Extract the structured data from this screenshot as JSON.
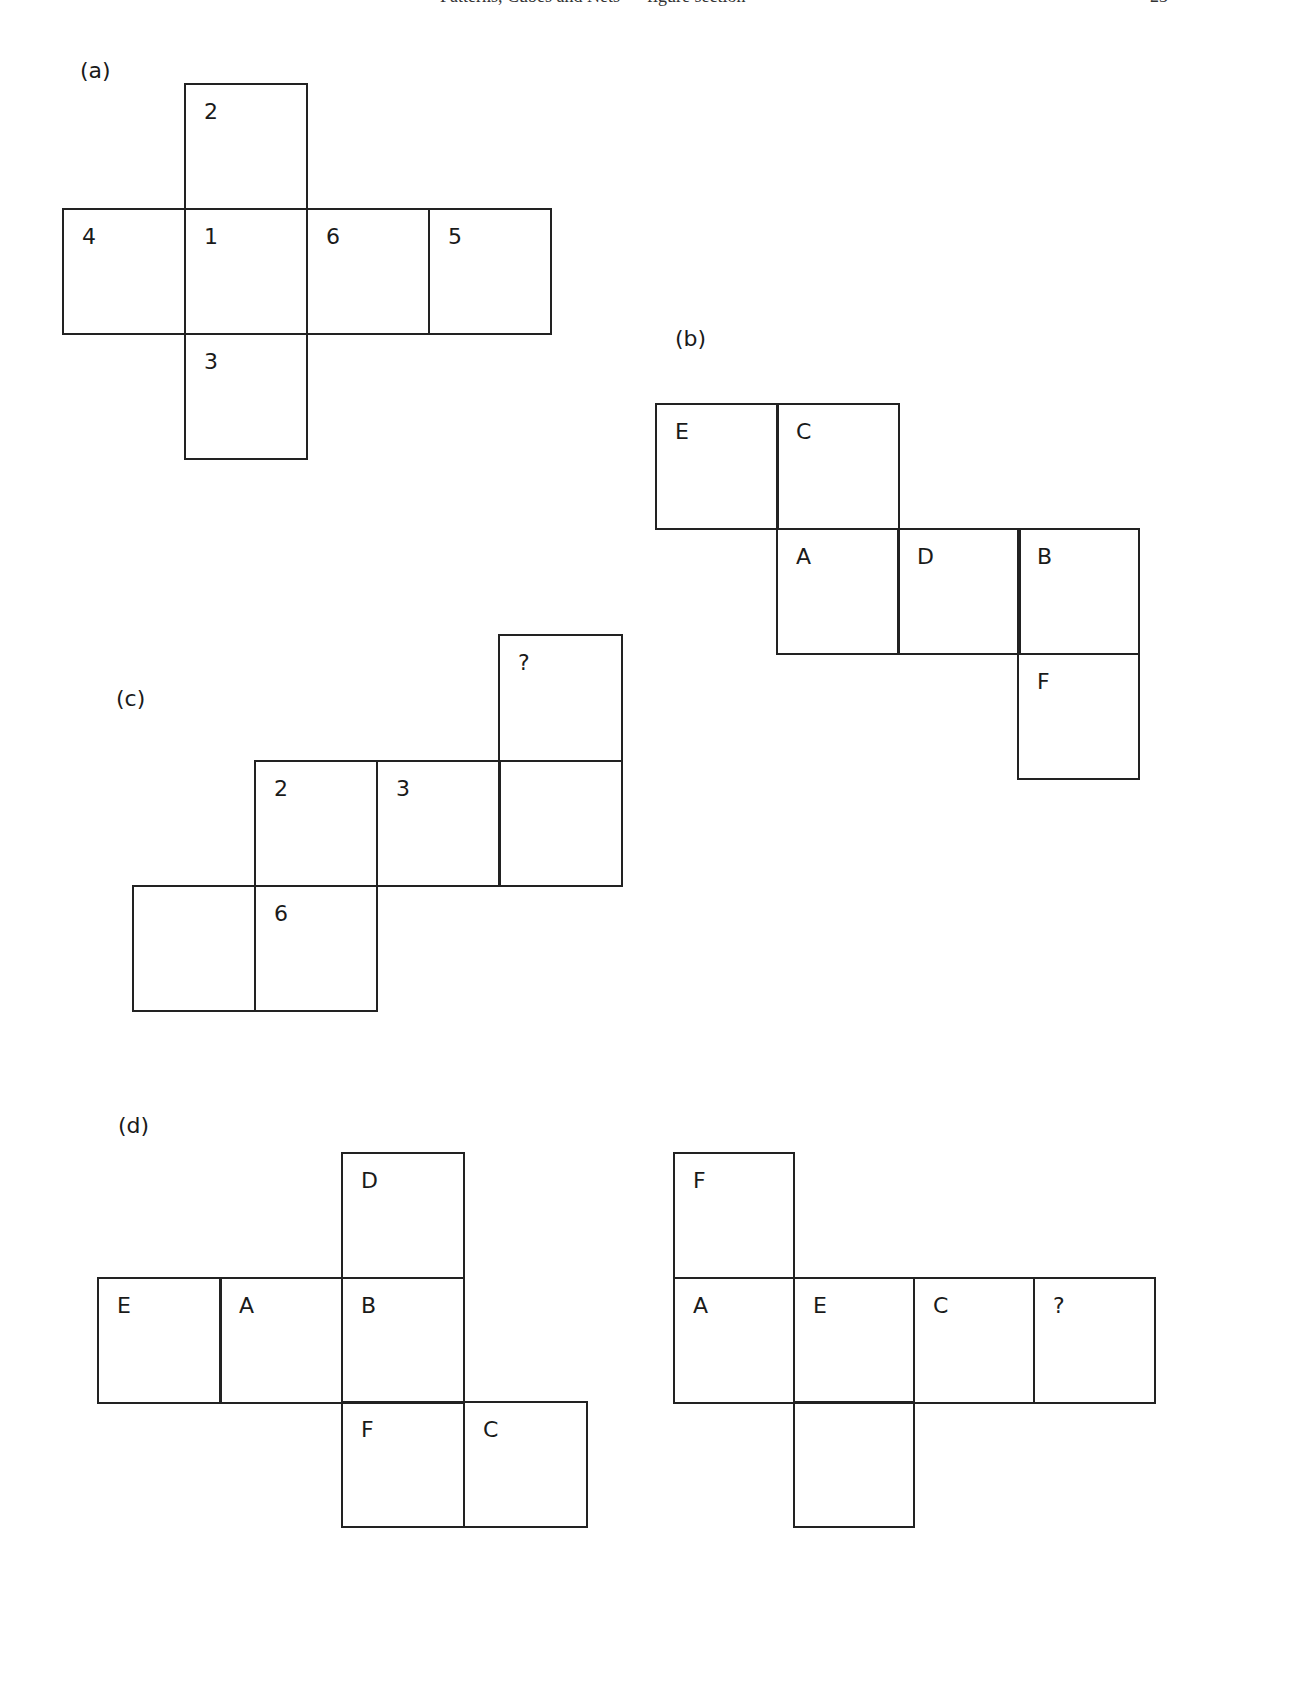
{
  "header": {
    "running_title": "Patterns, Cubes and Nets — figure section",
    "page_number": "23"
  },
  "figures": {
    "a": {
      "label": "(a)",
      "cells": [
        "2",
        "4",
        "1",
        "6",
        "5",
        "3"
      ]
    },
    "b": {
      "label": "(b)",
      "cells": [
        "E",
        "C",
        "A",
        "D",
        "B",
        "F"
      ]
    },
    "c": {
      "label": "(c)",
      "cells": [
        "?",
        "2",
        "3",
        "",
        "",
        "6"
      ]
    },
    "d": {
      "label": "(d)",
      "left": {
        "cells": [
          "D",
          "E",
          "A",
          "B",
          "F",
          "C"
        ]
      },
      "right": {
        "cells": [
          "F",
          "A",
          "E",
          "C",
          "?",
          ""
        ]
      }
    }
  }
}
